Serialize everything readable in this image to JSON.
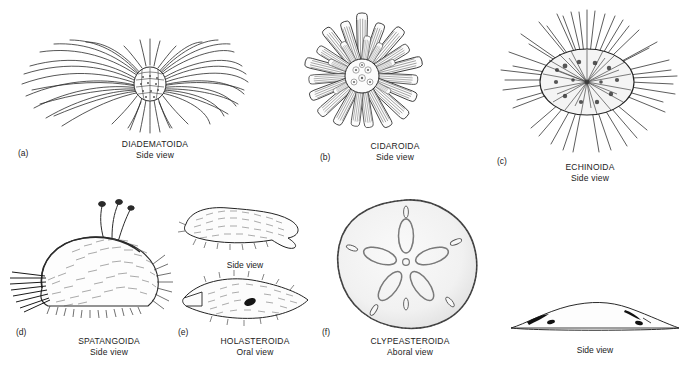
{
  "figure": {
    "background": "#ffffff",
    "ink": "#1a1a1a"
  },
  "panels": [
    {
      "id": "a",
      "letter": "(a)",
      "name": "DIADEMATOIDA",
      "view": "Side view",
      "subject": "long-spined sea urchin with slender curved radiating spines"
    },
    {
      "id": "b",
      "letter": "(b)",
      "name": "CIDAROIDA",
      "view": "Side view",
      "subject": "slate-pencil urchin with thick blunt club-shaped primary spines"
    },
    {
      "id": "c",
      "letter": "(c)",
      "name": "ECHINOIDA",
      "view": "Side view",
      "subject": "regular urchin with dense straight needle-like spines"
    },
    {
      "id": "d",
      "letter": "(d)",
      "name": "SPATANGOIDA",
      "view": "Side view",
      "subject": "heart urchin covered in fine hair-like spines with tube feet"
    },
    {
      "id": "e",
      "letter": "(e)",
      "name": "HOLASTEROIDA",
      "view": "Oral view",
      "subject": "irregular urchin shown in two orientations",
      "inner_caption": "Side view"
    },
    {
      "id": "f",
      "letter": "(f)",
      "name": "CLYPEASTEROIDA",
      "view": "Aboral view",
      "subject": "sand dollar with five-petalled petalodium and lunules",
      "side_caption": "Side view"
    }
  ]
}
